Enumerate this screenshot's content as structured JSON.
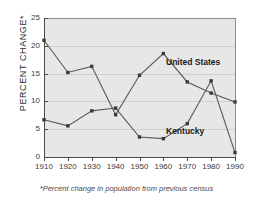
{
  "chart_data": {
    "type": "line",
    "title": "",
    "xlabel": "",
    "ylabel": "PERCENT CHANGE*",
    "footnote": "*Percent change in population from previous census",
    "categories": [
      1910,
      1920,
      1930,
      1940,
      1950,
      1960,
      1970,
      1980,
      1990
    ],
    "xtick_labels": [
      "1910",
      "1920",
      "1930",
      "1940",
      "1950",
      "1960",
      "1970",
      "1980",
      "1990"
    ],
    "ytick_labels": [
      "0",
      "5",
      "10",
      "15",
      "20",
      "25"
    ],
    "ytick_values": [
      0,
      5,
      10,
      15,
      20,
      25
    ],
    "ylim": [
      0,
      25
    ],
    "xlim": [
      1910,
      1990
    ],
    "grid": true,
    "legend_position": "inline-annotation",
    "series": [
      {
        "name": "United States",
        "label": "United States",
        "color": "#585858",
        "values": [
          21.0,
          15.2,
          16.3,
          7.6,
          14.7,
          18.6,
          13.5,
          11.5,
          9.9
        ]
      },
      {
        "name": "Kentucky",
        "label": "Kentucky",
        "color": "#585858",
        "values": [
          6.7,
          5.6,
          8.3,
          8.8,
          3.6,
          3.3,
          6.0,
          13.7,
          0.8
        ]
      }
    ]
  }
}
